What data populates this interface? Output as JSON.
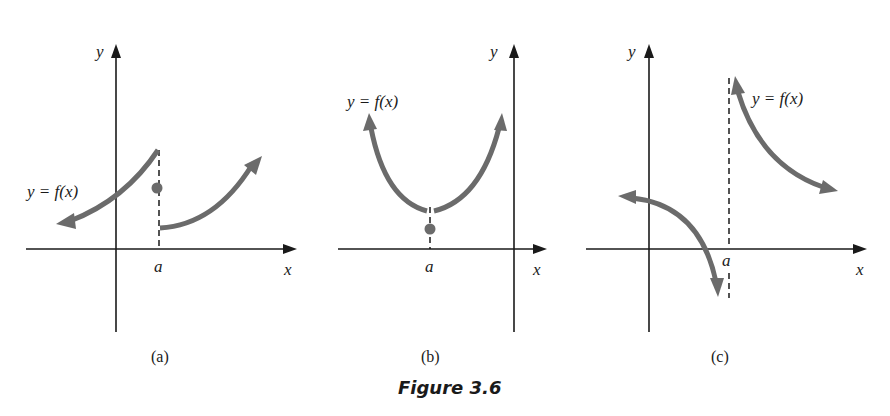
{
  "figure": {
    "title": "Figure 3.6",
    "panels": [
      {
        "id": "a",
        "caption": "(a)",
        "y_axis_label": "y",
        "x_axis_label": "x",
        "point_label": "a",
        "function_label": "y = f(x)",
        "description": "Jump discontinuity at x = a: left branch rises to an open endpoint, isolated filled point f(a), right branch starts lower and rises"
      },
      {
        "id": "b",
        "caption": "(b)",
        "y_axis_label": "y",
        "x_axis_label": "x",
        "point_label": "a",
        "function_label": "y = f(x)",
        "description": "Removable discontinuity at x = a: U-shaped curve with a gap at the vertex, filled point f(a) below the gap"
      },
      {
        "id": "c",
        "caption": "(c)",
        "y_axis_label": "y",
        "x_axis_label": "x",
        "point_label": "a",
        "function_label": "y = f(x)",
        "description": "Infinite discontinuity at x = a: vertical dashed asymptote, left branch goes down to -infinity, right branch comes from +infinity"
      }
    ]
  },
  "colors": {
    "curve": "#6b6b6b",
    "axis": "#1a1a1a",
    "background": "#ffffff"
  }
}
